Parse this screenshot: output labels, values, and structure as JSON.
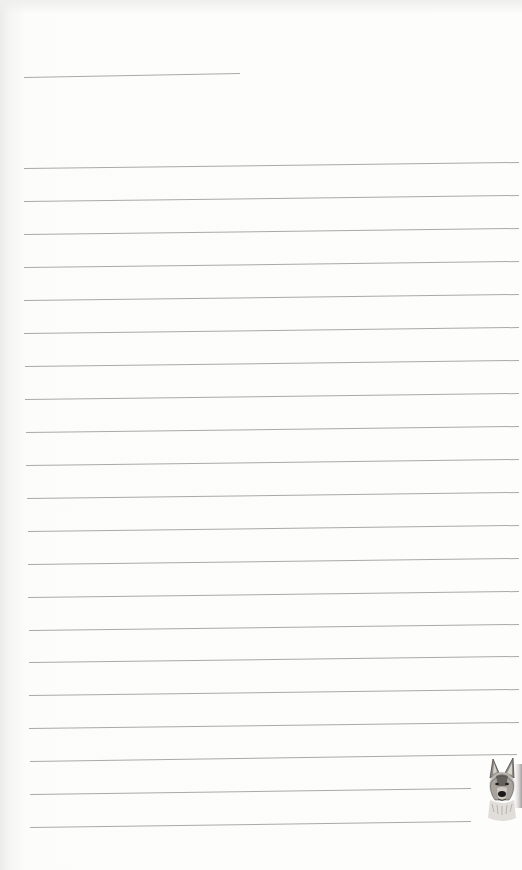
{
  "page": {
    "type": "lined-notepaper",
    "background_color": "#fbfbfa",
    "rule_color": "#a9a9a7"
  },
  "header_line": {
    "x1": 24,
    "y1": 77,
    "x2": 240,
    "y2": 73
  },
  "rules": [
    {
      "x1": 24,
      "y1": 168,
      "x2": 519,
      "y2": 162
    },
    {
      "x1": 24,
      "y1": 201,
      "x2": 519,
      "y2": 195
    },
    {
      "x1": 24,
      "y1": 234,
      "x2": 519,
      "y2": 228
    },
    {
      "x1": 24,
      "y1": 267,
      "x2": 519,
      "y2": 261
    },
    {
      "x1": 24,
      "y1": 300,
      "x2": 519,
      "y2": 294
    },
    {
      "x1": 24,
      "y1": 333,
      "x2": 519,
      "y2": 327
    },
    {
      "x1": 25,
      "y1": 366,
      "x2": 519,
      "y2": 360
    },
    {
      "x1": 25,
      "y1": 399,
      "x2": 519,
      "y2": 393
    },
    {
      "x1": 26,
      "y1": 432,
      "x2": 519,
      "y2": 426
    },
    {
      "x1": 26,
      "y1": 465,
      "x2": 519,
      "y2": 459
    },
    {
      "x1": 27,
      "y1": 498,
      "x2": 519,
      "y2": 492
    },
    {
      "x1": 28,
      "y1": 531,
      "x2": 519,
      "y2": 525
    },
    {
      "x1": 28,
      "y1": 564,
      "x2": 519,
      "y2": 558
    },
    {
      "x1": 28,
      "y1": 597,
      "x2": 519,
      "y2": 591
    },
    {
      "x1": 29,
      "y1": 630,
      "x2": 519,
      "y2": 624
    },
    {
      "x1": 29,
      "y1": 662,
      "x2": 519,
      "y2": 656
    },
    {
      "x1": 29,
      "y1": 695,
      "x2": 519,
      "y2": 689
    },
    {
      "x1": 29,
      "y1": 728,
      "x2": 519,
      "y2": 722
    },
    {
      "x1": 30,
      "y1": 761,
      "x2": 517,
      "y2": 754
    },
    {
      "x1": 30,
      "y1": 794,
      "x2": 471,
      "y2": 788
    },
    {
      "x1": 30,
      "y1": 827,
      "x2": 471,
      "y2": 821
    }
  ],
  "illustration": {
    "subject": "german-shepherd-dog-head",
    "style": "pencil-sketch",
    "position": "bottom-right"
  }
}
